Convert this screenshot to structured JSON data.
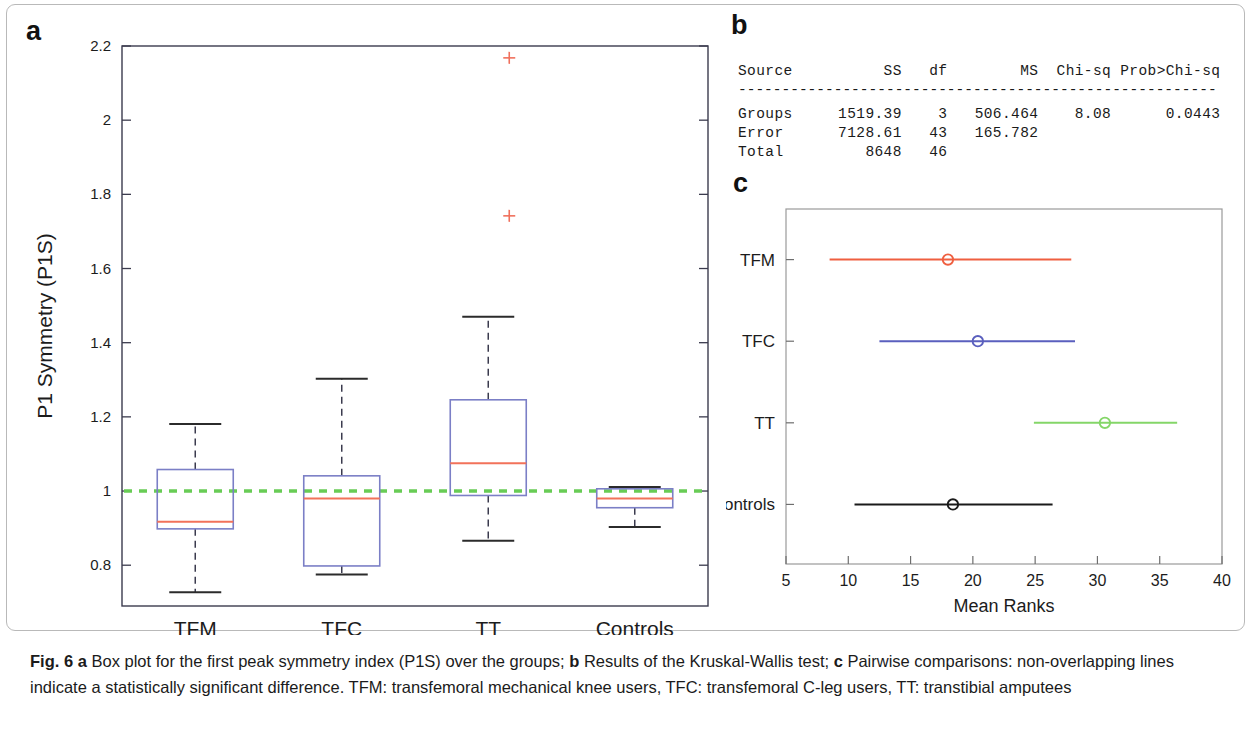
{
  "figure": {
    "panel_letters": {
      "a": "a",
      "b": "b",
      "c": "c"
    },
    "caption": {
      "fig_label": "Fig. 6",
      "a_tag": "a",
      "a_text": " Box plot for the first peak symmetry index (P1S) over the groups; ",
      "b_tag": "b",
      "b_text": " Results of the Kruskal-Wallis test; ",
      "c_tag": "c",
      "c_text": " Pairwise comparisons: non-overlapping lines indicate a statistically significant difference. TFM: transfemoral mechanical knee users, TFC: transfemoral C-leg users, TT: transtibial amputees"
    }
  },
  "colors": {
    "median_red": "#f2725a",
    "box_blue": "#7b7fc6",
    "reference_green": "#68cc55",
    "outlier_red": "#f0705c",
    "axis_dark": "#3b3b4e",
    "tfm_line": "#ef5f40",
    "tfc_line": "#5a5fbe",
    "tt_line": "#84d668",
    "controls_line": "#1a1a1a"
  },
  "chart_data": [
    {
      "id": "panel-a",
      "type": "box",
      "title": "",
      "xlabel": "",
      "ylabel": "P1 Symmetry (P1S)",
      "ylim": [
        0.69,
        2.2
      ],
      "yticks": [
        0.8,
        1,
        1.2,
        1.4,
        1.6,
        1.8,
        2,
        2.2
      ],
      "ytick_labels": [
        "0.8",
        "1",
        "1.2",
        "1.4",
        "1.6",
        "1.8",
        "2",
        "2.2"
      ],
      "categories": [
        "TFM",
        "TFC",
        "TT",
        "Controls"
      ],
      "reference_line": {
        "value": 1,
        "style": "dashed",
        "color": "#68cc55"
      },
      "boxes": [
        {
          "category": "TFM",
          "whisker_low": 0.727,
          "q1": 0.898,
          "median": 0.917,
          "q3": 1.058,
          "whisker_high": 1.181,
          "outliers": [],
          "half_width": 38
        },
        {
          "category": "TFC",
          "whisker_low": 0.775,
          "q1": 0.798,
          "median": 0.98,
          "q3": 1.041,
          "whisker_high": 1.303,
          "outliers": [],
          "half_width": 38
        },
        {
          "category": "TT",
          "whisker_low": 0.866,
          "q1": 0.988,
          "median": 1.075,
          "q3": 1.246,
          "whisker_high": 1.47,
          "outliers": [
            2.168,
            1.742
          ],
          "half_width": 38
        },
        {
          "category": "Controls",
          "whisker_low": 0.903,
          "q1": 0.955,
          "median": 0.98,
          "q3": 1.006,
          "whisker_high": 1.011,
          "outliers": [],
          "half_width": 38
        }
      ]
    },
    {
      "id": "panel-c",
      "type": "interval",
      "title": "",
      "xlabel": "Mean Ranks",
      "ylabel": "",
      "xlim": [
        5,
        40
      ],
      "xticks": [
        5,
        10,
        15,
        20,
        25,
        30,
        35,
        40
      ],
      "xtick_labels": [
        "5",
        "10",
        "15",
        "20",
        "25",
        "30",
        "35",
        "40"
      ],
      "categories": [
        "TFM",
        "TFC",
        "TT",
        "Controls"
      ],
      "intervals": [
        {
          "group": "TFM",
          "mean_rank": 18.0,
          "lower": 8.5,
          "upper": 27.9,
          "color": "#ef5f40"
        },
        {
          "group": "TFC",
          "mean_rank": 20.4,
          "lower": 12.5,
          "upper": 28.2,
          "color": "#5a5fbe"
        },
        {
          "group": "TT",
          "mean_rank": 30.6,
          "lower": 24.9,
          "upper": 36.4,
          "color": "#84d668"
        },
        {
          "group": "Controls",
          "mean_rank": 18.4,
          "lower": 10.5,
          "upper": 26.4,
          "color": "#1a1a1a"
        }
      ]
    },
    {
      "id": "panel-b",
      "type": "table",
      "title": "",
      "columns": [
        "Source",
        "SS",
        "df",
        "MS",
        "Chi-sq",
        "Prob>Chi-sq"
      ],
      "rows": [
        [
          "Groups",
          "1519.39",
          "3",
          "506.464",
          "8.08",
          "0.0443"
        ],
        [
          "Error",
          "7128.61",
          "43",
          "165.782",
          "",
          ""
        ],
        [
          "Total",
          "8648",
          "46",
          "",
          "",
          ""
        ]
      ],
      "separator": "-------------------------------------------------------"
    }
  ]
}
